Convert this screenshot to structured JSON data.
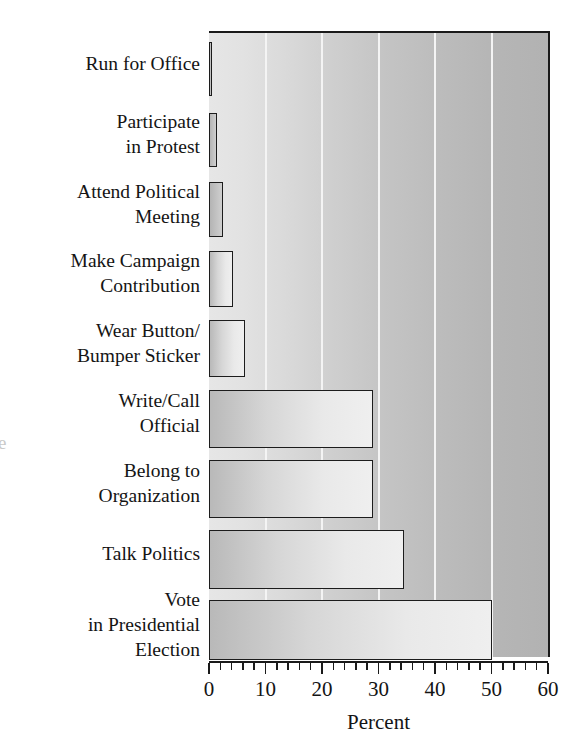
{
  "chart_data": {
    "type": "bar",
    "orientation": "horizontal",
    "title": "",
    "xlabel": "Percent",
    "ylabel": "",
    "xlim": [
      0,
      60
    ],
    "xticks": [
      0,
      10,
      20,
      30,
      40,
      50,
      60
    ],
    "xtick_labels": [
      "0",
      "10",
      "20",
      "30",
      "40",
      "50",
      "60"
    ],
    "minor_tick_step": 2,
    "grid": "vertical gridlines at 10, 20, 30, 40, 50 (white lines on gray panel)",
    "gridlines": [
      10,
      20,
      30,
      40,
      50
    ],
    "legend": "none",
    "categories": [
      "Run for Office",
      "Participate\nin Protest",
      "Attend Political\nMeeting",
      "Make Campaign\nContribution",
      "Wear Button/\nBumper Sticker",
      "Write/Call\nOfficial",
      "Belong to\nOrganization",
      "Talk Politics",
      "Vote\nin Presidential\nElection"
    ],
    "values": [
      0.5,
      1.5,
      2.5,
      4.3,
      6.4,
      29,
      29,
      34.5,
      50
    ],
    "bars": [
      {
        "label": "Run for Office",
        "label_lines": [
          "Run for Office"
        ],
        "value": 0.5,
        "top": 40,
        "height": 54
      },
      {
        "label": "Participate in Protest",
        "label_lines": [
          "Participate",
          "in Protest"
        ],
        "value": 1.5,
        "top": 111,
        "height": 54
      },
      {
        "label": "Attend Political Meeting",
        "label_lines": [
          "Attend Political",
          "Meeting"
        ],
        "value": 2.5,
        "top": 180,
        "height": 55
      },
      {
        "label": "Make Campaign Contribution",
        "label_lines": [
          "Make Campaign",
          "Contribution"
        ],
        "value": 4.3,
        "top": 249,
        "height": 56
      },
      {
        "label": "Wear Button/Bumper Sticker",
        "label_lines": [
          "Wear Button/",
          "Bumper Sticker"
        ],
        "value": 6.4,
        "top": 318,
        "height": 57
      },
      {
        "label": "Write/Call Official",
        "label_lines": [
          "Write/Call",
          "Official"
        ],
        "value": 29.0,
        "top": 388,
        "height": 58
      },
      {
        "label": "Belong to Organization",
        "label_lines": [
          "Belong to",
          "Organization"
        ],
        "value": 29.0,
        "top": 458,
        "height": 58
      },
      {
        "label": "Talk Politics",
        "label_lines": [
          "Talk Politics"
        ],
        "value": 34.5,
        "top": 528,
        "height": 59
      },
      {
        "label": "Vote in Presidential Election",
        "label_lines": [
          "Vote",
          "in Presidential",
          "Election"
        ],
        "value": 50.0,
        "top": 598,
        "height": 60
      }
    ],
    "colors": {
      "panel_light": "#e6e6e6",
      "panel_dark": "#b2b2b2",
      "gridline": "#f4f4f4",
      "bar_fill_light": "#efefef",
      "bar_fill_dark": "#b9b9b9",
      "outline": "#1c1c1c",
      "text": "#141414"
    }
  },
  "axis": {
    "title": "Percent",
    "tick_labels": [
      "0",
      "10",
      "20",
      "30",
      "40",
      "50",
      "60"
    ]
  },
  "artifacts": {
    "page_bleed_glyph": "e"
  }
}
